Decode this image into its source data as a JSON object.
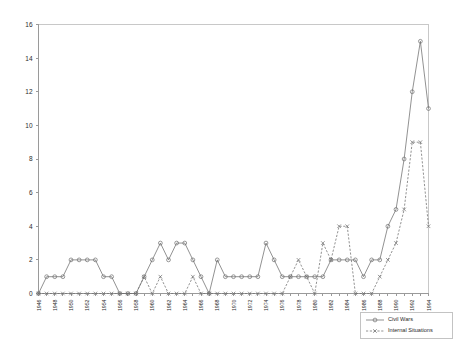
{
  "chart_data": {
    "type": "line",
    "title": "",
    "subtitle": "",
    "xlabel": "",
    "ylabel": "",
    "ylim": [
      0,
      16
    ],
    "ytick_step": 2,
    "yticks": [
      "0",
      "2",
      "4",
      "6",
      "8",
      "10",
      "12",
      "14",
      "16"
    ],
    "grid": false,
    "legend_position": "bottom-right",
    "xtick_label_rotation": -90,
    "xtick_label_interval": 2,
    "x": [
      1946,
      1947,
      1948,
      1949,
      1950,
      1951,
      1952,
      1953,
      1954,
      1955,
      1956,
      1957,
      1958,
      1959,
      1960,
      1961,
      1962,
      1963,
      1964,
      1965,
      1966,
      1967,
      1968,
      1969,
      1970,
      1971,
      1972,
      1973,
      1974,
      1975,
      1976,
      1977,
      1978,
      1979,
      1980,
      1981,
      1982,
      1983,
      1984,
      1985,
      1986,
      1987,
      1988,
      1989,
      1990,
      1991,
      1992,
      1993,
      1994
    ],
    "xtick_labels": [
      "1946",
      "1948",
      "1950",
      "1952",
      "1954",
      "1956",
      "1958",
      "1960",
      "1962",
      "1964",
      "1966",
      "1968",
      "1970",
      "1972",
      "1974",
      "1976",
      "1978",
      "1980",
      "1982",
      "1984",
      "1986",
      "1988",
      "1990",
      "1992",
      "1994"
    ],
    "series": [
      {
        "name": "Civil Wars",
        "marker": "circle",
        "linestyle": "solid",
        "color": "#6e6e6e",
        "values": [
          0,
          1,
          1,
          1,
          2,
          2,
          2,
          2,
          1,
          1,
          0,
          0,
          0,
          1,
          2,
          3,
          2,
          3,
          3,
          2,
          1,
          0,
          2,
          1,
          1,
          1,
          1,
          1,
          3,
          2,
          1,
          1,
          1,
          1,
          1,
          1,
          2,
          2,
          2,
          2,
          1,
          2,
          2,
          4,
          5,
          8,
          12,
          15,
          11
        ]
      },
      {
        "name": "Internal Situations",
        "marker": "x",
        "linestyle": "dashed",
        "color": "#6e6e6e",
        "values": [
          0,
          0,
          0,
          0,
          0,
          0,
          0,
          0,
          0,
          0,
          0,
          0,
          0,
          1,
          0,
          1,
          0,
          0,
          0,
          1,
          0,
          0,
          0,
          0,
          0,
          0,
          0,
          0,
          0,
          0,
          0,
          1,
          2,
          1,
          0,
          3,
          2,
          4,
          4,
          0,
          0,
          0,
          1,
          2,
          3,
          5,
          9,
          9,
          4
        ]
      }
    ]
  },
  "legend": {
    "entries": [
      {
        "label": "Civil Wars",
        "marker": "circle"
      },
      {
        "label": "Internal Situations",
        "marker": "x"
      }
    ]
  }
}
